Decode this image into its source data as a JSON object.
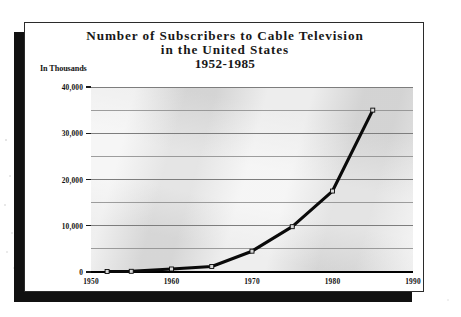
{
  "figure": {
    "title_lines": [
      "Number of Subscribers to Cable Television",
      "in the United States",
      "1952-1985"
    ],
    "y_axis_caption": "In Thousands"
  },
  "chart_data": {
    "type": "line",
    "title": "Number of Subscribers to Cable Television in the United States 1952-1985",
    "xlabel": "",
    "ylabel": "In Thousands",
    "xlim": [
      1950,
      1990
    ],
    "ylim": [
      0,
      40000
    ],
    "grid": true,
    "legend": "none",
    "x_tick_labels": [
      "1950",
      "1960",
      "1970",
      "1980",
      "1990"
    ],
    "x_ticks": [
      1950,
      1960,
      1970,
      1980,
      1990
    ],
    "y_tick_labels": [
      "0",
      "10,000",
      "20,000",
      "30,000",
      "40,000"
    ],
    "y_ticks": [
      0,
      10000,
      20000,
      30000,
      40000
    ],
    "y_gridlines": [
      0,
      5000,
      10000,
      15000,
      20000,
      25000,
      30000,
      35000,
      40000
    ],
    "series": [
      {
        "name": "Cable television subscribers",
        "x": [
          1952,
          1955,
          1960,
          1965,
          1970,
          1975,
          1980,
          1985
        ],
        "values": [
          100,
          150,
          650,
          1200,
          4500,
          9800,
          17500,
          35000
        ]
      }
    ]
  }
}
